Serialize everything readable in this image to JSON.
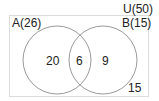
{
  "diagram": {
    "type": "venn",
    "universe": {
      "label": "U(50)",
      "total": 50
    },
    "sets": [
      {
        "id": "A",
        "label": "A(26)",
        "total": 26
      },
      {
        "id": "B",
        "label": "B(15)",
        "total": 15
      }
    ],
    "regions": {
      "only_a": "20",
      "a_and_b": "6",
      "only_b": "9",
      "outside": "15"
    },
    "colors": {
      "stroke": "#9a9a9a",
      "border": "#d9d9d9",
      "text": "#222222"
    }
  }
}
